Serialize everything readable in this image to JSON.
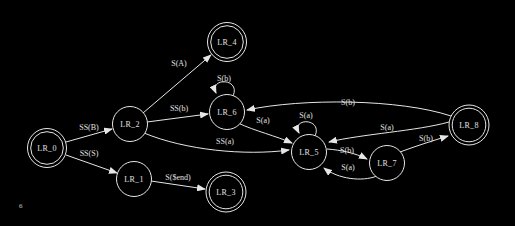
{
  "diagram": {
    "colors": {
      "background": "#000000",
      "stroke": "#e6e6e6",
      "text": "#e0e0e0"
    },
    "page_marker": "6",
    "nodes": [
      {
        "id": "LR_0",
        "label": "LR_0",
        "x": 47,
        "y": 148,
        "r": 19.5,
        "double": true
      },
      {
        "id": "LR_1",
        "label": "LR_1",
        "x": 134,
        "y": 179,
        "r": 17.5,
        "double": false
      },
      {
        "id": "LR_2",
        "label": "LR_2",
        "x": 130,
        "y": 124,
        "r": 17.5,
        "double": false
      },
      {
        "id": "LR_3",
        "label": "LR_3",
        "x": 226,
        "y": 192,
        "r": 20,
        "double": true
      },
      {
        "id": "LR_4",
        "label": "LR_4",
        "x": 227,
        "y": 42,
        "r": 19.5,
        "double": true
      },
      {
        "id": "LR_5",
        "label": "LR_5",
        "x": 309,
        "y": 152,
        "r": 17.5,
        "double": false
      },
      {
        "id": "LR_6",
        "label": "LR_6",
        "x": 227,
        "y": 112,
        "r": 17.5,
        "double": false
      },
      {
        "id": "LR_7",
        "label": "LR_7",
        "x": 387,
        "y": 163,
        "r": 17.5,
        "double": false
      },
      {
        "id": "LR_8",
        "label": "LR_8",
        "x": 469,
        "y": 125,
        "r": 20,
        "double": true
      }
    ],
    "edges": [
      {
        "from": "LR_0",
        "to": "LR_2",
        "label": "SS(B)",
        "path": "M66,142 L112,129",
        "lx": 89,
        "ly": 127
      },
      {
        "from": "LR_0",
        "to": "LR_1",
        "label": "SS(S)",
        "path": "M66,155 L117,173",
        "lx": 89,
        "ly": 153
      },
      {
        "from": "LR_1",
        "to": "LR_3",
        "label": "S($end)",
        "path": "M151,181 L205,189",
        "lx": 178,
        "ly": 177
      },
      {
        "from": "LR_2",
        "to": "LR_4",
        "label": "S(A)",
        "path": "M143,113 L211,55",
        "lx": 179,
        "ly": 63
      },
      {
        "from": "LR_2",
        "to": "LR_6",
        "label": "SS(b)",
        "path": "M147,122 L208,114",
        "lx": 179,
        "ly": 108
      },
      {
        "from": "LR_2",
        "to": "LR_5",
        "label": "SS(a)",
        "path": "M144,133 C185,150 245,156 289,150",
        "lx": 225,
        "ly": 141
      },
      {
        "from": "LR_6",
        "to": "LR_6",
        "label": "S(b)",
        "path": "M233,96 C241,78 209,77 216,93",
        "lx": 224,
        "ly": 78
      },
      {
        "from": "LR_6",
        "to": "LR_5",
        "label": "S(a)",
        "path": "M238,123 C255,131 276,136 292,143",
        "lx": 263,
        "ly": 120
      },
      {
        "from": "LR_5",
        "to": "LR_5",
        "label": "S(a)",
        "path": "M315,136 C323,118 291,117 299,133",
        "lx": 306,
        "ly": 115
      },
      {
        "from": "LR_5",
        "to": "LR_7",
        "label": "S(b)",
        "path": "M327,149 C341,150 355,153 367,159",
        "lx": 347,
        "ly": 150
      },
      {
        "from": "LR_7",
        "to": "LR_5",
        "label": "S(a)",
        "path": "M377,176 C362,182 338,179 324,168",
        "lx": 348,
        "ly": 167
      },
      {
        "from": "LR_7",
        "to": "LR_8",
        "label": "S(b)",
        "path": "M400,152 C416,146 432,141 448,136",
        "lx": 426,
        "ly": 138
      },
      {
        "from": "LR_8",
        "to": "LR_6",
        "label": "S(b)",
        "path": "M451,116 C400,99 303,98 247,110",
        "lx": 348,
        "ly": 102
      },
      {
        "from": "LR_8",
        "to": "LR_5",
        "label": "S(a)",
        "path": "M449,122 C417,131 362,134 329,142",
        "lx": 387,
        "ly": 127
      }
    ]
  }
}
